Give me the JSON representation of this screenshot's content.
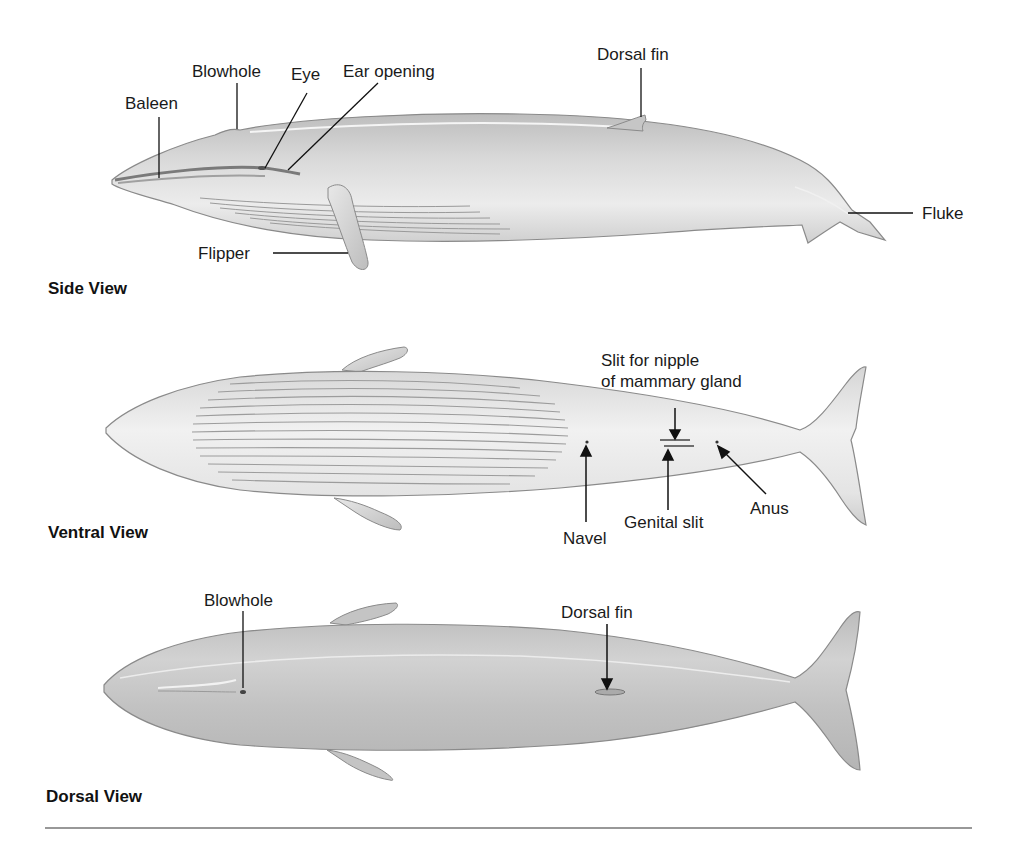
{
  "figure": {
    "colors": {
      "body_light": "#e6e6e6",
      "body_mid": "#c8c8c8",
      "body_dark": "#a8a8a8",
      "outline": "#8a8a8a",
      "leader": "#111111",
      "rule": "#333333"
    }
  },
  "views": {
    "side": {
      "title": "Side View",
      "labels": {
        "baleen": "Baleen",
        "blowhole": "Blowhole",
        "eye": "Eye",
        "ear_opening": "Ear opening",
        "dorsal_fin": "Dorsal fin",
        "fluke": "Fluke",
        "flipper": "Flipper"
      }
    },
    "ventral": {
      "title": "Ventral View",
      "labels": {
        "slit_for_nipple": "Slit for nipple\nof mammary gland",
        "navel": "Navel",
        "genital_slit": "Genital slit",
        "anus": "Anus"
      }
    },
    "dorsal": {
      "title": "Dorsal View",
      "labels": {
        "blowhole": "Blowhole",
        "dorsal_fin": "Dorsal fin"
      }
    }
  }
}
